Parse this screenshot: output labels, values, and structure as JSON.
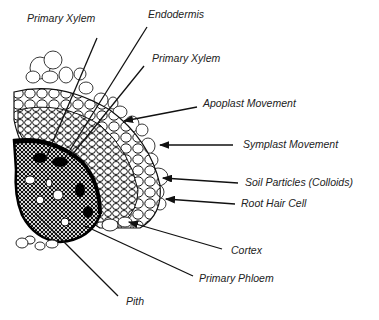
{
  "figure": {
    "labels": [
      {
        "id": "primary-xylem-1",
        "text": "Primary Xylem",
        "x": 27,
        "y": 12
      },
      {
        "id": "endodermis",
        "text": "Endodermis",
        "x": 148,
        "y": 8
      },
      {
        "id": "primary-xylem-2",
        "text": "Primary Xylem",
        "x": 152,
        "y": 52
      },
      {
        "id": "apoplast-movement",
        "text": "Apoplast Movement",
        "x": 203,
        "y": 97
      },
      {
        "id": "symplast-movement",
        "text": "Symplast Movement",
        "x": 243,
        "y": 138
      },
      {
        "id": "soil-particles",
        "text": "Soil Particles (Colloids)",
        "x": 245,
        "y": 176
      },
      {
        "id": "root-hair-cell",
        "text": "Root Hair Cell",
        "x": 241,
        "y": 197
      },
      {
        "id": "cortex",
        "text": "Cortex",
        "x": 231,
        "y": 244
      },
      {
        "id": "primary-phloem",
        "text": "Primary Phloem",
        "x": 199,
        "y": 272
      },
      {
        "id": "pith",
        "text": "Pith",
        "x": 126,
        "y": 295
      }
    ],
    "lines": [
      {
        "for": "primary-xylem-1",
        "x1": 97,
        "y1": 38,
        "x2": 45,
        "y2": 160,
        "arrow": false
      },
      {
        "for": "endodermis",
        "x1": 147,
        "y1": 27,
        "x2": 65,
        "y2": 158,
        "arrow": false
      },
      {
        "for": "primary-xylem-2",
        "x1": 144,
        "y1": 66,
        "x2": 72,
        "y2": 155,
        "arrow": false
      },
      {
        "for": "apoplast-movement",
        "x1": 197,
        "y1": 107,
        "x2": 124,
        "y2": 121,
        "arrow": true
      },
      {
        "for": "symplast-movement",
        "x1": 233,
        "y1": 145,
        "x2": 160,
        "y2": 145,
        "arrow": true
      },
      {
        "for": "soil-particles",
        "x1": 238,
        "y1": 183,
        "x2": 163,
        "y2": 178,
        "arrow": true
      },
      {
        "for": "root-hair-cell",
        "x1": 235,
        "y1": 204,
        "x2": 166,
        "y2": 199,
        "arrow": true
      },
      {
        "for": "cortex",
        "x1": 222,
        "y1": 249,
        "x2": 129,
        "y2": 222,
        "arrow": true
      },
      {
        "for": "primary-phloem",
        "x1": 193,
        "y1": 276,
        "x2": 85,
        "y2": 226,
        "arrow": false
      },
      {
        "for": "pith",
        "x1": 118,
        "y1": 296,
        "x2": 35,
        "y2": 213,
        "arrow": false
      }
    ]
  }
}
